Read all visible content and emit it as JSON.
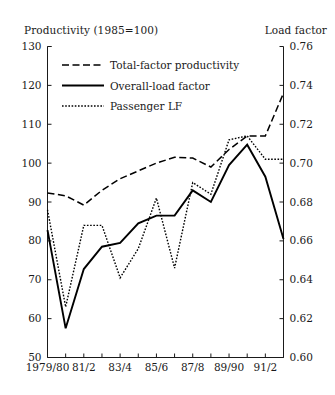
{
  "chart_data": {
    "type": "line",
    "title": "",
    "left_axis": {
      "label": "Productivity (1985=100)",
      "ticks": [
        50,
        60,
        70,
        80,
        90,
        100,
        110,
        120,
        130
      ],
      "ylim": [
        50,
        130
      ]
    },
    "right_axis": {
      "label": "Load factor",
      "ticks": [
        "0.60",
        "0.62",
        "0.64",
        "0.66",
        "0.68",
        "0.70",
        "0.72",
        "0.74",
        "0.76"
      ],
      "ylim": [
        0.6,
        0.76
      ]
    },
    "xlabel": "",
    "x": [
      "1979/80",
      "80/1",
      "81/2",
      "82/3",
      "83/4",
      "84/5",
      "85/6",
      "86/7",
      "87/8",
      "88/9",
      "89/90",
      "90/1",
      "91/2",
      "92/3"
    ],
    "x_tick_labels": [
      "1979/80",
      "",
      "81/2",
      "",
      "83/4",
      "",
      "85/6",
      "",
      "87/8",
      "",
      "89/90",
      "",
      "91/2",
      ""
    ],
    "grid": false,
    "legend_position": "top-left",
    "series": [
      {
        "name": "Total-factor productivity",
        "axis": "left",
        "style": "dashed",
        "values": [
          92.3,
          91.6,
          89.2,
          93.0,
          96.0,
          98.0,
          100.0,
          101.5,
          101.3,
          99.0,
          103.5,
          107.0,
          107.0,
          118.0
        ]
      },
      {
        "name": "Overall-load factor",
        "axis": "right",
        "style": "solid",
        "values": [
          0.6655,
          0.615,
          0.6455,
          0.657,
          0.659,
          0.669,
          0.673,
          0.673,
          0.686,
          0.68,
          0.699,
          0.7095,
          0.693,
          0.661
        ]
      },
      {
        "name": "Passenger LF",
        "axis": "left",
        "style": "dotted",
        "values": [
          88.0,
          63.0,
          84.0,
          84.0,
          70.5,
          78.0,
          91.0,
          73.0,
          95.0,
          92.0,
          106.0,
          107.0,
          101.0,
          101.0
        ]
      }
    ],
    "legend": [
      {
        "label": "Total-factor productivity",
        "style": "dashed"
      },
      {
        "label": "Overall-load factor",
        "style": "solid"
      },
      {
        "label": "Passenger LF",
        "style": "dotted"
      }
    ]
  }
}
